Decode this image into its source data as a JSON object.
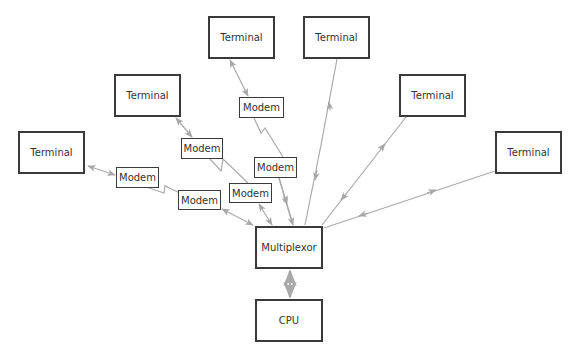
{
  "diagram": {
    "type": "network-topology",
    "colors": {
      "box_border": "#3a3a3a",
      "link": "#aaaaaa",
      "text": "#333333",
      "background": "#ffffff"
    },
    "nodes": {
      "terminal_1": {
        "label": "Terminal",
        "x": 208,
        "y": 16,
        "w": 67,
        "h": 43
      },
      "terminal_2": {
        "label": "Terminal",
        "x": 303,
        "y": 16,
        "w": 67,
        "h": 43
      },
      "terminal_3": {
        "label": "Terminal",
        "x": 114,
        "y": 74,
        "w": 67,
        "h": 43
      },
      "terminal_4": {
        "label": "Terminal",
        "x": 399,
        "y": 74,
        "w": 67,
        "h": 43
      },
      "terminal_5": {
        "label": "Terminal",
        "x": 18,
        "y": 131,
        "w": 67,
        "h": 43
      },
      "terminal_6": {
        "label": "Terminal",
        "x": 495,
        "y": 131,
        "w": 67,
        "h": 43
      },
      "modem_a": {
        "label": "Modem",
        "x": 239,
        "y": 97,
        "w": 45,
        "h": 21
      },
      "modem_b": {
        "label": "Modem",
        "x": 181,
        "y": 138,
        "w": 42,
        "h": 21
      },
      "modem_c": {
        "label": "Modem",
        "x": 254,
        "y": 157,
        "w": 43,
        "h": 21
      },
      "modem_d": {
        "label": "Modem",
        "x": 116,
        "y": 167,
        "w": 43,
        "h": 21
      },
      "modem_e": {
        "label": "Modem",
        "x": 178,
        "y": 190,
        "w": 43,
        "h": 20
      },
      "modem_f": {
        "label": "Modem",
        "x": 229,
        "y": 183,
        "w": 43,
        "h": 20
      },
      "multiplexor": {
        "label": "Multiplexor",
        "x": 255,
        "y": 226,
        "w": 68,
        "h": 43
      },
      "cpu": {
        "label": "CPU",
        "x": 255,
        "y": 299,
        "w": 68,
        "h": 43
      }
    },
    "links": [
      {
        "from": "terminal_1",
        "to": "modem_a",
        "style": "bidirectional"
      },
      {
        "from": "modem_a",
        "to": "modem_c",
        "style": "phone-line-zigzag"
      },
      {
        "from": "modem_c",
        "to": "multiplexor",
        "style": "bidirectional"
      },
      {
        "from": "terminal_3",
        "to": "modem_b",
        "style": "bidirectional"
      },
      {
        "from": "modem_b",
        "to": "modem_f",
        "style": "phone-line-zigzag"
      },
      {
        "from": "modem_f",
        "to": "multiplexor",
        "style": "bidirectional"
      },
      {
        "from": "terminal_5",
        "to": "modem_d",
        "style": "bidirectional"
      },
      {
        "from": "modem_d",
        "to": "modem_e",
        "style": "phone-line-zigzag"
      },
      {
        "from": "modem_e",
        "to": "multiplexor",
        "style": "bidirectional"
      },
      {
        "from": "terminal_2",
        "to": "multiplexor",
        "style": "bidirectional"
      },
      {
        "from": "terminal_4",
        "to": "multiplexor",
        "style": "bidirectional"
      },
      {
        "from": "terminal_6",
        "to": "multiplexor",
        "style": "bidirectional"
      },
      {
        "from": "multiplexor",
        "to": "cpu",
        "style": "bidirectional"
      }
    ]
  }
}
